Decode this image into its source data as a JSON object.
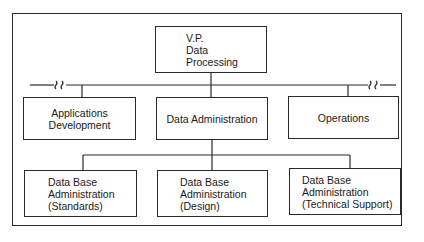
{
  "diagram": {
    "type": "org-chart",
    "root": {
      "id": "vp",
      "label": "V.P.\nData\nProcessing"
    },
    "level1": [
      {
        "id": "appdev",
        "label": "Applications\nDevelopment"
      },
      {
        "id": "dataadmin",
        "label": "Data Administration"
      },
      {
        "id": "ops",
        "label": "Operations"
      }
    ],
    "level2": [
      {
        "id": "dba-std",
        "label": "Data Base\nAdministration\n(Standards)"
      },
      {
        "id": "dba-design",
        "label": "Data Base\nAdministration\n(Design)"
      },
      {
        "id": "dba-tech",
        "label": "Data Base\nAdministration\n(Technical Support)"
      }
    ],
    "edges": [
      [
        "vp",
        "appdev"
      ],
      [
        "vp",
        "dataadmin"
      ],
      [
        "vp",
        "ops"
      ],
      [
        "dataadmin",
        "dba-std"
      ],
      [
        "dataadmin",
        "dba-design"
      ],
      [
        "dataadmin",
        "dba-tech"
      ]
    ],
    "annotations": [
      "line-break-left",
      "line-break-right"
    ]
  }
}
